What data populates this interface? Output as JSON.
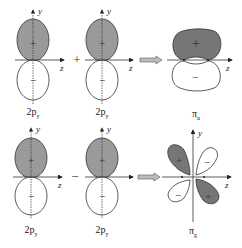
{
  "colors": {
    "lobe_fill": "#9a9a9a",
    "pi_u_fill": "#767676",
    "line": "#333333",
    "arrow_fill": "#bdbdbd"
  },
  "row1": {
    "orbital_a": {
      "label_main": "2p",
      "label_sub": "y",
      "upper_sign": "+",
      "lower_sign": "−"
    },
    "operator": "+",
    "orbital_b": {
      "label_main": "2p",
      "label_sub": "y",
      "upper_sign": "+",
      "lower_sign": "−"
    },
    "result": {
      "label_main": "π",
      "label_sub": "u",
      "upper_sign": "+",
      "lower_sign": "−"
    }
  },
  "row2": {
    "orbital_a": {
      "label_main": "2p",
      "label_sub": "y",
      "upper_sign": "+",
      "lower_sign": "−"
    },
    "operator": "−",
    "orbital_b": {
      "label_main": "2p",
      "label_sub": "y",
      "upper_sign": "+",
      "lower_sign": "−"
    },
    "result": {
      "label_main": "π",
      "label_sub": "g",
      "signs": [
        "+",
        "−",
        "−",
        "+"
      ]
    }
  },
  "axes": {
    "y": "y",
    "z": "z"
  }
}
